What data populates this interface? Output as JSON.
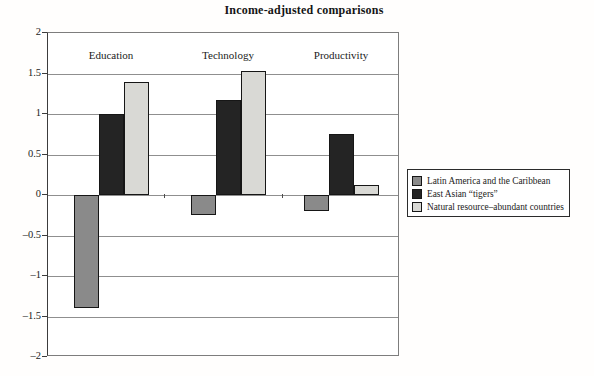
{
  "chart_data": {
    "type": "bar",
    "title": "Income-adjusted comparisons",
    "categories": [
      "Education",
      "Technology",
      "Productivity"
    ],
    "series": [
      {
        "name": "Latin America and the Caribbean",
        "color": "#8a8a8a",
        "values": [
          -1.4,
          -0.25,
          -0.2
        ]
      },
      {
        "name": "East Asian “tigers”",
        "color": "#242424",
        "values": [
          1.0,
          1.17,
          0.75
        ]
      },
      {
        "name": "Natural resource–abundant countries",
        "color": "#d9d9d5",
        "values": [
          1.4,
          1.53,
          0.12
        ]
      }
    ],
    "xlabel": "",
    "ylabel": "",
    "ylim": [
      -2,
      2
    ],
    "yticks": [
      2,
      1.5,
      1,
      0.5,
      0,
      -0.5,
      -1,
      -1.5,
      -2
    ],
    "ytick_labels": [
      "2",
      "1.5",
      "1",
      "0.5",
      "0",
      "–0.5",
      "–1",
      "–1.5",
      "–2"
    ],
    "grid": true,
    "legend_position": "right"
  }
}
